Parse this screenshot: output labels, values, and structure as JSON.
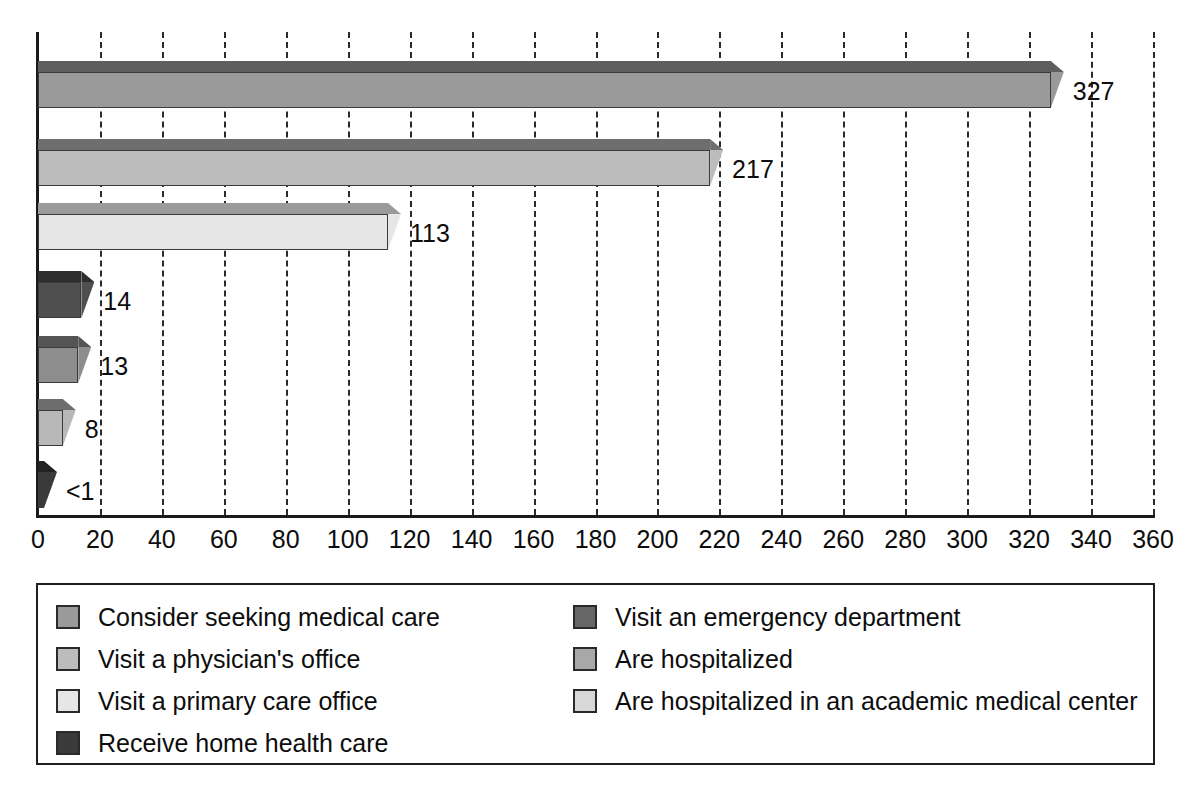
{
  "chart_data": {
    "type": "bar",
    "orientation": "horizontal",
    "title": "",
    "subtitle": "",
    "xlabel": "",
    "ylabel": "",
    "xlim": [
      0,
      360
    ],
    "xtick_step": 20,
    "grid": true,
    "legend_position": "bottom",
    "categories": [
      "Consider seeking medical care",
      "Visit a physician's office",
      "Visit a primary care office",
      "Visit an emergency department",
      "Are hospitalized",
      "Are hospitalized in an academic medical center",
      "Receive home health care"
    ],
    "values": [
      327,
      217,
      113,
      14,
      13,
      8,
      0.5
    ],
    "value_labels": [
      "327",
      "217",
      "113",
      "14",
      "13",
      "8",
      "<1"
    ],
    "bar_colors": [
      "#9a9a9a",
      "#bcbcbc",
      "#e6e6e6",
      "#4f4f4f",
      "#8d8d8d",
      "#b8b8b8",
      "#3a3a3a"
    ],
    "ticks": [
      "0",
      "20",
      "40",
      "60",
      "80",
      "100",
      "120",
      "140",
      "160",
      "180",
      "200",
      "220",
      "240",
      "260",
      "280",
      "300",
      "320",
      "340",
      "360"
    ]
  },
  "bars": [
    {
      "label": "327",
      "value": 327,
      "color": "#9a9a9a",
      "top_color": "#5e5e5e"
    },
    {
      "label": "217",
      "value": 217,
      "color": "#bcbcbc",
      "top_color": "#6e6e6e"
    },
    {
      "label": "113",
      "value": 113,
      "color": "#e6e6e6",
      "top_color": "#9a9a9a"
    },
    {
      "label": "14",
      "value": 14,
      "color": "#4f4f4f",
      "top_color": "#2e2e2e"
    },
    {
      "label": "13",
      "value": 13,
      "color": "#8d8d8d",
      "top_color": "#545454"
    },
    {
      "label": "8",
      "value": 8,
      "color": "#b8b8b8",
      "top_color": "#6d6d6d"
    },
    {
      "label": "<1",
      "value": 0.5,
      "color": "#3a3a3a",
      "top_color": "#222222"
    }
  ],
  "axis": {
    "ticks": [
      {
        "label": "0",
        "value": 0
      },
      {
        "label": "20",
        "value": 20
      },
      {
        "label": "40",
        "value": 40
      },
      {
        "label": "60",
        "value": 60
      },
      {
        "label": "80",
        "value": 80
      },
      {
        "label": "100",
        "value": 100
      },
      {
        "label": "120",
        "value": 120
      },
      {
        "label": "140",
        "value": 140
      },
      {
        "label": "160",
        "value": 160
      },
      {
        "label": "180",
        "value": 180
      },
      {
        "label": "200",
        "value": 200
      },
      {
        "label": "220",
        "value": 220
      },
      {
        "label": "240",
        "value": 240
      },
      {
        "label": "260",
        "value": 260
      },
      {
        "label": "280",
        "value": 280
      },
      {
        "label": "300",
        "value": 300
      },
      {
        "label": "320",
        "value": 320
      },
      {
        "label": "340",
        "value": 340
      },
      {
        "label": "360",
        "value": 360
      }
    ],
    "max": 360
  },
  "legend": {
    "left_column": [
      {
        "label": "Consider seeking medical care",
        "color": "#9a9a9a"
      },
      {
        "label": "Visit a physician's office",
        "color": "#bcbcbc"
      },
      {
        "label": "Visit a primary care office",
        "color": "#e6e6e6"
      },
      {
        "label": "Receive home health care",
        "color": "#3a3a3a"
      }
    ],
    "right_column": [
      {
        "label": "Visit an emergency department",
        "color": "#666666"
      },
      {
        "label": "Are hospitalized",
        "color": "#a8a8a8"
      },
      {
        "label": "Are hospitalized in an academic medical center",
        "color": "#d8d8d8"
      }
    ]
  }
}
